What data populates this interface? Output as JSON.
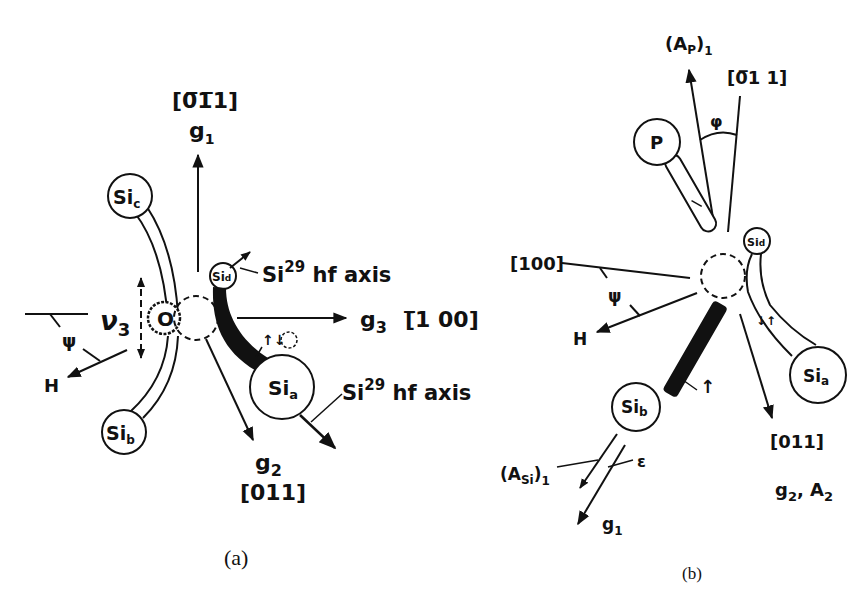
{
  "figure": {
    "panels": [
      {
        "id": "a",
        "caption": "(a)",
        "atoms": {
          "si_c": "Si",
          "si_c_sub": "c",
          "si_b": "Si",
          "si_b_sub": "b",
          "si_a": "Si",
          "si_a_sub": "a",
          "si_d": "Si",
          "si_d_sub": "d",
          "oxygen": "O"
        },
        "axes": {
          "g1_dir": "[0̅1̅1]",
          "g1_label": "g",
          "g1_sub": "1",
          "g3_label": "g",
          "g3_sub": "3",
          "g3_dir": "[̅1 00]",
          "g2_label": "g",
          "g2_sub": "2",
          "g2_dir": "[011]"
        },
        "annotations": {
          "hf_axis_top": "Si",
          "hf_axis_top_sup": "29",
          "hf_axis_top_text": " hf axis",
          "hf_axis_bottom": "Si",
          "hf_axis_bottom_sup": "29",
          "hf_axis_bottom_text": " hf axis",
          "nu3": "ν",
          "nu3_sub": "3",
          "psi": "ψ",
          "H": "H",
          "spin_pair": "↑↓"
        }
      },
      {
        "id": "b",
        "caption": "(b)",
        "atoms": {
          "P": "P",
          "si_b": "Si",
          "si_b_sub": "b",
          "si_a": "Si",
          "si_a_sub": "a",
          "si_d": "Si",
          "si_d_sub": "d"
        },
        "axes": {
          "Ap1": "(A",
          "Ap1_sub": "P",
          "Ap1_tail": ")",
          "Ap1_idx": "1",
          "dir_top": "[0̅1 1]",
          "dir_100": "[100]",
          "dir_011": "[011]",
          "g2A2": "g",
          "g2A2_sub1": "2",
          "g2A2_mid": ", A",
          "g2A2_sub2": "2",
          "ASi1": "(A",
          "ASi1_sub": "Si",
          "ASi1_tail": ")",
          "ASi1_idx": "1",
          "g1": "g",
          "g1_sub": "1"
        },
        "annotations": {
          "phi": "φ",
          "psi": "ψ",
          "H": "H",
          "epsilon": "ε",
          "spin_up": "↑",
          "spin_pair": "↓↑"
        }
      }
    ]
  }
}
